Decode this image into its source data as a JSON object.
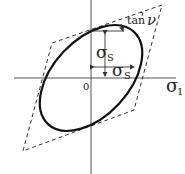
{
  "diagram": {
    "labels": {
      "origin": "0",
      "x_axis": "σ",
      "x_axis_sub": "1",
      "sigma_s_vertical": "σ",
      "sigma_s_vertical_sub": "S",
      "sigma_s_horizontal": "σ",
      "sigma_s_horizontal_sub": "S",
      "tan": "tan",
      "nu": "ν"
    },
    "colors": {
      "curve": "#111111",
      "axis": "#555555",
      "dashed": "#333333"
    }
  }
}
